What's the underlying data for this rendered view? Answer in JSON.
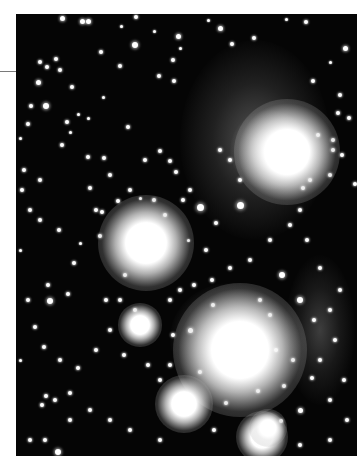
{
  "image": {
    "subject": "star cluster with reflection nebulosity",
    "style": "black-and-white astrophotograph",
    "colors": {
      "background": "#050505",
      "page": "#ffffff",
      "rule": "#7a7a7a"
    }
  },
  "nebulae": [
    {
      "x": 255,
      "y": 140,
      "w": 150,
      "h": 200,
      "op": 0.35
    },
    {
      "x": 270,
      "y": 150,
      "w": 80,
      "h": 80,
      "op": 0.75
    },
    {
      "x": 230,
      "y": 338,
      "w": 120,
      "h": 110,
      "op": 0.45
    },
    {
      "x": 320,
      "y": 330,
      "w": 70,
      "h": 150,
      "op": 0.25
    }
  ],
  "bright_stars": [
    {
      "x": 146,
      "y": 243,
      "r": 20
    },
    {
      "x": 287,
      "y": 152,
      "r": 22
    },
    {
      "x": 240,
      "y": 350,
      "r": 28
    },
    {
      "x": 184,
      "y": 404,
      "r": 12
    },
    {
      "x": 140,
      "y": 325,
      "r": 9
    },
    {
      "x": 262,
      "y": 437,
      "r": 11
    },
    {
      "x": 268,
      "y": 428,
      "r": 8
    }
  ],
  "stars": [
    [
      62,
      18,
      2.5
    ],
    [
      82,
      21,
      2.5
    ],
    [
      88,
      21,
      2.5
    ],
    [
      136,
      17,
      2
    ],
    [
      121,
      26,
      1.5
    ],
    [
      154,
      31,
      1.5
    ],
    [
      178,
      36,
      2.5
    ],
    [
      135,
      45,
      3
    ],
    [
      101,
      52,
      2
    ],
    [
      120,
      66,
      2
    ],
    [
      159,
      76,
      2
    ],
    [
      173,
      60,
      2
    ],
    [
      56,
      59,
      2
    ],
    [
      40,
      62,
      2
    ],
    [
      47,
      67,
      2
    ],
    [
      60,
      70,
      2
    ],
    [
      38,
      82,
      2.5
    ],
    [
      103,
      97,
      1.5
    ],
    [
      72,
      87,
      2
    ],
    [
      78,
      114,
      1.5
    ],
    [
      174,
      81,
      2
    ],
    [
      180,
      48,
      1.5
    ],
    [
      208,
      20,
      1.5
    ],
    [
      220,
      28,
      2.5
    ],
    [
      232,
      44,
      2
    ],
    [
      254,
      38,
      2
    ],
    [
      286,
      19,
      1.5
    ],
    [
      306,
      22,
      2
    ],
    [
      345,
      48,
      2.5
    ],
    [
      330,
      62,
      1.5
    ],
    [
      313,
      81,
      2
    ],
    [
      340,
      95,
      2
    ],
    [
      338,
      113,
      2
    ],
    [
      318,
      135,
      2
    ],
    [
      333,
      140,
      2
    ],
    [
      333,
      150,
      2
    ],
    [
      349,
      118,
      2
    ],
    [
      342,
      155,
      2
    ],
    [
      330,
      175,
      2
    ],
    [
      310,
      180,
      2
    ],
    [
      303,
      188,
      2
    ],
    [
      355,
      184,
      2
    ],
    [
      46,
      106,
      3
    ],
    [
      31,
      106,
      2
    ],
    [
      28,
      124,
      2
    ],
    [
      67,
      122,
      2
    ],
    [
      70,
      132,
      1.5
    ],
    [
      88,
      118,
      1.5
    ],
    [
      62,
      145,
      2
    ],
    [
      88,
      157,
      2
    ],
    [
      104,
      158,
      2
    ],
    [
      128,
      127,
      2
    ],
    [
      145,
      160,
      2
    ],
    [
      160,
      151,
      2
    ],
    [
      170,
      161,
      2
    ],
    [
      176,
      172,
      2
    ],
    [
      190,
      190,
      2
    ],
    [
      183,
      200,
      2
    ],
    [
      200,
      207,
      3.5
    ],
    [
      240,
      205,
      3.5
    ],
    [
      216,
      223,
      2
    ],
    [
      206,
      250,
      2
    ],
    [
      230,
      268,
      2
    ],
    [
      212,
      280,
      2
    ],
    [
      194,
      285,
      2
    ],
    [
      180,
      290,
      2
    ],
    [
      170,
      300,
      2
    ],
    [
      173,
      335,
      2
    ],
    [
      190,
      330,
      2.5
    ],
    [
      213,
      305,
      2
    ],
    [
      260,
      300,
      2
    ],
    [
      270,
      315,
      2
    ],
    [
      300,
      300,
      3
    ],
    [
      282,
      275,
      3
    ],
    [
      307,
      240,
      2
    ],
    [
      320,
      268,
      2
    ],
    [
      314,
      320,
      2
    ],
    [
      330,
      310,
      2
    ],
    [
      340,
      290,
      2
    ],
    [
      335,
      340,
      2
    ],
    [
      320,
      360,
      2
    ],
    [
      344,
      380,
      2
    ],
    [
      312,
      378,
      2
    ],
    [
      330,
      400,
      2
    ],
    [
      300,
      410,
      2.5
    ],
    [
      347,
      420,
      2
    ],
    [
      330,
      440,
      2
    ],
    [
      300,
      445,
      2
    ],
    [
      281,
      421,
      2
    ],
    [
      226,
      403,
      2
    ],
    [
      214,
      430,
      2
    ],
    [
      160,
      440,
      2
    ],
    [
      130,
      430,
      2
    ],
    [
      110,
      420,
      2
    ],
    [
      90,
      410,
      2
    ],
    [
      70,
      420,
      2
    ],
    [
      58,
      452,
      3
    ],
    [
      45,
      440,
      2
    ],
    [
      30,
      440,
      2
    ],
    [
      70,
      393,
      2
    ],
    [
      55,
      400,
      2
    ],
    [
      42,
      405,
      2
    ],
    [
      46,
      396,
      2
    ],
    [
      78,
      368,
      2
    ],
    [
      60,
      360,
      2
    ],
    [
      44,
      347,
      2
    ],
    [
      35,
      327,
      2
    ],
    [
      28,
      300,
      2
    ],
    [
      50,
      301,
      3
    ],
    [
      48,
      285,
      2
    ],
    [
      68,
      294,
      2
    ],
    [
      74,
      263,
      2
    ],
    [
      80,
      243,
      1.5
    ],
    [
      100,
      236,
      2
    ],
    [
      102,
      212,
      2
    ],
    [
      96,
      210,
      2
    ],
    [
      118,
      201,
      2
    ],
    [
      130,
      190,
      2
    ],
    [
      90,
      188,
      2
    ],
    [
      110,
      175,
      2
    ],
    [
      140,
      198,
      1.5
    ],
    [
      59,
      230,
      2
    ],
    [
      40,
      220,
      2
    ],
    [
      30,
      210,
      2
    ],
    [
      22,
      190,
      2
    ],
    [
      24,
      170,
      2
    ],
    [
      40,
      180,
      2
    ],
    [
      106,
      300,
      2
    ],
    [
      110,
      330,
      2
    ],
    [
      124,
      355,
      2
    ],
    [
      148,
      365,
      2
    ],
    [
      160,
      380,
      2
    ],
    [
      170,
      365,
      2
    ],
    [
      200,
      372,
      2
    ],
    [
      258,
      391,
      2
    ],
    [
      284,
      386,
      2
    ],
    [
      293,
      360,
      2
    ],
    [
      276,
      350,
      2
    ],
    [
      240,
      180,
      2
    ],
    [
      230,
      160,
      2
    ],
    [
      220,
      150,
      2
    ],
    [
      250,
      260,
      2
    ],
    [
      270,
      240,
      2
    ],
    [
      290,
      225,
      2
    ],
    [
      300,
      210,
      2
    ],
    [
      154,
      200,
      2
    ],
    [
      165,
      215,
      2
    ],
    [
      188,
      240,
      1.5
    ],
    [
      125,
      275,
      2
    ],
    [
      120,
      300,
      2
    ],
    [
      135,
      310,
      2
    ],
    [
      96,
      350,
      2
    ],
    [
      20,
      138,
      1.5
    ],
    [
      20,
      250,
      1.5
    ],
    [
      20,
      360,
      1.5
    ]
  ]
}
